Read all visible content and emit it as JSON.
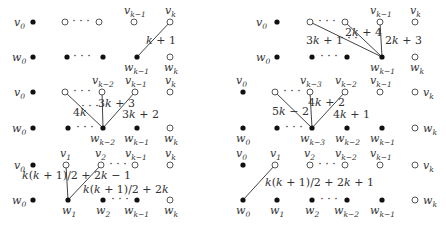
{
  "colors": {
    "filled": "#111111",
    "hollow_stroke": "#444444",
    "edge": "#444444",
    "text": "#333333"
  },
  "panels": [
    {
      "id": "top-left",
      "nodes": [
        {
          "label": "v",
          "sub": "0",
          "x": 33,
          "y": 22,
          "filled": true,
          "lx": 14,
          "ly": 26
        },
        {
          "label": "",
          "sub": "",
          "x": 65,
          "y": 22,
          "filled": false
        },
        {
          "label": "",
          "sub": "",
          "x": 99,
          "y": 22,
          "filled": false
        },
        {
          "label": "v",
          "sub": "k−1",
          "x": 134,
          "y": 22,
          "filled": false,
          "lx": 124,
          "ly": 14
        },
        {
          "label": "v",
          "sub": "k",
          "x": 170,
          "y": 22,
          "filled": false,
          "lx": 165,
          "ly": 14
        },
        {
          "label": "w",
          "sub": "0",
          "x": 33,
          "y": 57,
          "filled": true,
          "lx": 12,
          "ly": 61
        },
        {
          "label": "",
          "sub": "",
          "x": 67,
          "y": 57,
          "filled": true
        },
        {
          "label": "",
          "sub": "",
          "x": 103,
          "y": 57,
          "filled": true
        },
        {
          "label": "w",
          "sub": "k−1",
          "x": 137,
          "y": 57,
          "filled": true,
          "lx": 124,
          "ly": 71
        },
        {
          "label": "w",
          "sub": "k",
          "x": 170,
          "y": 57,
          "filled": false,
          "lx": 164,
          "ly": 71
        }
      ],
      "dots": [
        {
          "x": 81,
          "y": 22
        },
        {
          "x": 82,
          "y": 57
        }
      ],
      "edges": [
        {
          "x1": 137,
          "y1": 57,
          "x2": 170,
          "y2": 22
        }
      ],
      "edge_labels": [
        {
          "text": "k + 1",
          "x": 146,
          "y": 44
        }
      ]
    },
    {
      "id": "top-right",
      "nodes": [
        {
          "label": "v",
          "sub": "0",
          "x": 277,
          "y": 22,
          "filled": true,
          "lx": 256,
          "ly": 26
        },
        {
          "label": "",
          "sub": "",
          "x": 310,
          "y": 22,
          "filled": false
        },
        {
          "label": "",
          "sub": "",
          "x": 345,
          "y": 22,
          "filled": false
        },
        {
          "label": "v",
          "sub": "k−1",
          "x": 380,
          "y": 22,
          "filled": false,
          "lx": 370,
          "ly": 14
        },
        {
          "label": "v",
          "sub": "k",
          "x": 415,
          "y": 22,
          "filled": false,
          "lx": 410,
          "ly": 14
        },
        {
          "label": "w",
          "sub": "0",
          "x": 277,
          "y": 57,
          "filled": true,
          "lx": 256,
          "ly": 61
        },
        {
          "label": "",
          "sub": "",
          "x": 312,
          "y": 57,
          "filled": true
        },
        {
          "label": "",
          "sub": "",
          "x": 347,
          "y": 57,
          "filled": true
        },
        {
          "label": "w",
          "sub": "k−1",
          "x": 382,
          "y": 57,
          "filled": true,
          "lx": 370,
          "ly": 71
        },
        {
          "label": "w",
          "sub": "k",
          "x": 415,
          "y": 57,
          "filled": false,
          "lx": 410,
          "ly": 71
        }
      ],
      "dots": [
        {
          "x": 327,
          "y": 22
        },
        {
          "x": 329,
          "y": 57
        },
        {
          "x": 349,
          "y": 39
        }
      ],
      "edges": [
        {
          "x1": 382,
          "y1": 57,
          "x2": 310,
          "y2": 22
        },
        {
          "x1": 382,
          "y1": 57,
          "x2": 345,
          "y2": 22
        },
        {
          "x1": 382,
          "y1": 57,
          "x2": 380,
          "y2": 22
        }
      ],
      "edge_labels": [
        {
          "text": "3k + 1",
          "x": 306,
          "y": 44
        },
        {
          "text": "2k + 4",
          "x": 345,
          "y": 36
        },
        {
          "text": "2k + 3",
          "x": 385,
          "y": 44
        }
      ]
    },
    {
      "id": "middle-left",
      "nodes": [
        {
          "label": "v",
          "sub": "0",
          "x": 33,
          "y": 92,
          "filled": true,
          "lx": 14,
          "ly": 96
        },
        {
          "label": "",
          "sub": "",
          "x": 65,
          "y": 92,
          "filled": false
        },
        {
          "label": "v",
          "sub": "k−2",
          "x": 102,
          "y": 92,
          "filled": false,
          "lx": 92,
          "ly": 84
        },
        {
          "label": "v",
          "sub": "k−1",
          "x": 135,
          "y": 92,
          "filled": false,
          "lx": 125,
          "ly": 84
        },
        {
          "label": "v",
          "sub": "k",
          "x": 170,
          "y": 92,
          "filled": false,
          "lx": 165,
          "ly": 84
        },
        {
          "label": "w",
          "sub": "0",
          "x": 33,
          "y": 128,
          "filled": true,
          "lx": 12,
          "ly": 132
        },
        {
          "label": "",
          "sub": "",
          "x": 68,
          "y": 128,
          "filled": true
        },
        {
          "label": "w",
          "sub": "k−2",
          "x": 103,
          "y": 128,
          "filled": true,
          "lx": 90,
          "ly": 142
        },
        {
          "label": "w",
          "sub": "k−1",
          "x": 137,
          "y": 128,
          "filled": true,
          "lx": 124,
          "ly": 142
        },
        {
          "label": "w",
          "sub": "k",
          "x": 170,
          "y": 128,
          "filled": false,
          "lx": 164,
          "ly": 142
        }
      ],
      "dots": [
        {
          "x": 82,
          "y": 92
        },
        {
          "x": 85,
          "y": 128
        },
        {
          "x": 90,
          "y": 107
        }
      ],
      "edges": [
        {
          "x1": 103,
          "y1": 128,
          "x2": 65,
          "y2": 92
        },
        {
          "x1": 103,
          "y1": 128,
          "x2": 102,
          "y2": 92
        },
        {
          "x1": 103,
          "y1": 128,
          "x2": 135,
          "y2": 92
        }
      ],
      "edge_labels": [
        {
          "text": "4k",
          "x": 73,
          "y": 116
        },
        {
          "text": "3k + 3",
          "x": 98,
          "y": 107
        },
        {
          "text": "3k + 2",
          "x": 122,
          "y": 118
        }
      ]
    },
    {
      "id": "middle-right",
      "nodes": [
        {
          "label": "v",
          "sub": "0",
          "x": 243,
          "y": 92,
          "filled": true,
          "lx": 236,
          "ly": 84
        },
        {
          "label": "",
          "sub": "",
          "x": 275,
          "y": 92,
          "filled": false
        },
        {
          "label": "v",
          "sub": "k−3",
          "x": 310,
          "y": 92,
          "filled": false,
          "lx": 300,
          "ly": 84
        },
        {
          "label": "v",
          "sub": "k−2",
          "x": 345,
          "y": 92,
          "filled": false,
          "lx": 335,
          "ly": 84
        },
        {
          "label": "v",
          "sub": "k−1",
          "x": 380,
          "y": 92,
          "filled": false,
          "lx": 370,
          "ly": 84
        },
        {
          "label": "v",
          "sub": "k",
          "x": 415,
          "y": 92,
          "filled": false,
          "lx": 423,
          "ly": 96
        },
        {
          "label": "w",
          "sub": "0",
          "x": 243,
          "y": 128,
          "filled": true,
          "lx": 236,
          "ly": 142
        },
        {
          "label": "",
          "sub": "",
          "x": 277,
          "y": 128,
          "filled": true
        },
        {
          "label": "w",
          "sub": "k−3",
          "x": 312,
          "y": 128,
          "filled": true,
          "lx": 300,
          "ly": 142
        },
        {
          "label": "w",
          "sub": "k−2",
          "x": 347,
          "y": 128,
          "filled": true,
          "lx": 335,
          "ly": 142
        },
        {
          "label": "w",
          "sub": "k−1",
          "x": 382,
          "y": 128,
          "filled": true,
          "lx": 370,
          "ly": 142
        },
        {
          "label": "w",
          "sub": "k",
          "x": 415,
          "y": 128,
          "filled": false,
          "lx": 423,
          "ly": 132
        }
      ],
      "dots": [
        {
          "x": 292,
          "y": 92
        },
        {
          "x": 294,
          "y": 128
        }
      ],
      "edges": [
        {
          "x1": 312,
          "y1": 128,
          "x2": 275,
          "y2": 92
        },
        {
          "x1": 312,
          "y1": 128,
          "x2": 310,
          "y2": 92
        },
        {
          "x1": 312,
          "y1": 128,
          "x2": 345,
          "y2": 92
        }
      ],
      "edge_labels": [
        {
          "text": "5k − 2",
          "x": 272,
          "y": 115
        },
        {
          "text": "4k + 2",
          "x": 308,
          "y": 106
        },
        {
          "text": "4k + 1",
          "x": 333,
          "y": 118
        }
      ]
    },
    {
      "id": "bottom-left",
      "nodes": [
        {
          "label": "v",
          "sub": "0",
          "x": 33,
          "y": 165,
          "filled": true,
          "lx": 14,
          "ly": 169
        },
        {
          "label": "v",
          "sub": "1",
          "x": 66,
          "y": 165,
          "filled": false,
          "lx": 60,
          "ly": 157
        },
        {
          "label": "v",
          "sub": "2",
          "x": 101,
          "y": 165,
          "filled": false,
          "lx": 95,
          "ly": 157
        },
        {
          "label": "v",
          "sub": "k−1",
          "x": 135,
          "y": 165,
          "filled": false,
          "lx": 125,
          "ly": 157
        },
        {
          "label": "v",
          "sub": "k",
          "x": 170,
          "y": 165,
          "filled": false,
          "lx": 165,
          "ly": 157
        },
        {
          "label": "w",
          "sub": "0",
          "x": 33,
          "y": 200,
          "filled": true,
          "lx": 12,
          "ly": 204
        },
        {
          "label": "w",
          "sub": "1",
          "x": 68,
          "y": 200,
          "filled": true,
          "lx": 62,
          "ly": 214
        },
        {
          "label": "w",
          "sub": "2",
          "x": 103,
          "y": 200,
          "filled": true,
          "lx": 96,
          "ly": 214
        },
        {
          "label": "w",
          "sub": "k−1",
          "x": 137,
          "y": 200,
          "filled": true,
          "lx": 124,
          "ly": 214
        },
        {
          "label": "w",
          "sub": "k",
          "x": 170,
          "y": 200,
          "filled": false,
          "lx": 164,
          "ly": 214
        }
      ],
      "dots": [
        {
          "x": 118,
          "y": 165
        },
        {
          "x": 120,
          "y": 200
        }
      ],
      "edges": [
        {
          "x1": 68,
          "y1": 200,
          "x2": 66,
          "y2": 165
        },
        {
          "x1": 68,
          "y1": 200,
          "x2": 101,
          "y2": 165
        }
      ],
      "edge_labels": [
        {
          "text": "k(k + 1)/2 + 2k − 1",
          "x": 22,
          "y": 179
        },
        {
          "text": "k(k + 1)/2 + 2k",
          "x": 83,
          "y": 193
        }
      ]
    },
    {
      "id": "bottom-right",
      "nodes": [
        {
          "label": "v",
          "sub": "0",
          "x": 243,
          "y": 165,
          "filled": true,
          "lx": 236,
          "ly": 157
        },
        {
          "label": "v",
          "sub": "1",
          "x": 275,
          "y": 165,
          "filled": false,
          "lx": 270,
          "ly": 157
        },
        {
          "label": "v",
          "sub": "2",
          "x": 310,
          "y": 165,
          "filled": false,
          "lx": 304,
          "ly": 157
        },
        {
          "label": "v",
          "sub": "k−2",
          "x": 345,
          "y": 165,
          "filled": false,
          "lx": 335,
          "ly": 157
        },
        {
          "label": "v",
          "sub": "k−1",
          "x": 380,
          "y": 165,
          "filled": false,
          "lx": 370,
          "ly": 157
        },
        {
          "label": "v",
          "sub": "k",
          "x": 415,
          "y": 165,
          "filled": false,
          "lx": 423,
          "ly": 169
        },
        {
          "label": "w",
          "sub": "0",
          "x": 243,
          "y": 200,
          "filled": true,
          "lx": 236,
          "ly": 214
        },
        {
          "label": "w",
          "sub": "1",
          "x": 277,
          "y": 200,
          "filled": true,
          "lx": 270,
          "ly": 214
        },
        {
          "label": "w",
          "sub": "2",
          "x": 312,
          "y": 200,
          "filled": true,
          "lx": 305,
          "ly": 214
        },
        {
          "label": "w",
          "sub": "k−2",
          "x": 347,
          "y": 200,
          "filled": true,
          "lx": 334,
          "ly": 214
        },
        {
          "label": "w",
          "sub": "k−1",
          "x": 382,
          "y": 200,
          "filled": true,
          "lx": 370,
          "ly": 214
        },
        {
          "label": "w",
          "sub": "k",
          "x": 415,
          "y": 200,
          "filled": false,
          "lx": 423,
          "ly": 204
        }
      ],
      "dots": [
        {
          "x": 327,
          "y": 165
        },
        {
          "x": 329,
          "y": 200
        }
      ],
      "edges": [
        {
          "x1": 243,
          "y1": 200,
          "x2": 275,
          "y2": 165
        }
      ],
      "edge_labels": [
        {
          "text": "k(k + 1)/2 + 2k + 1",
          "x": 265,
          "y": 186
        }
      ]
    }
  ]
}
